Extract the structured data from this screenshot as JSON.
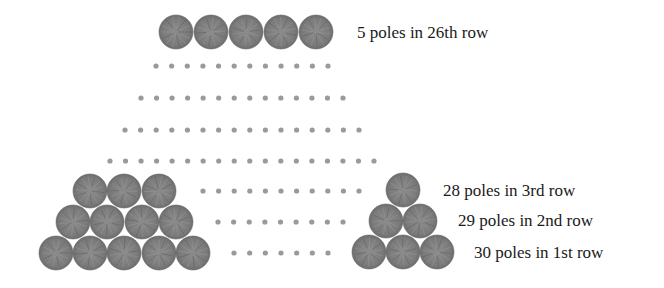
{
  "diagram": {
    "colors": {
      "pole_fill": "#7d7d7d",
      "pole_edge": "#6a6a6a",
      "pole_grain": "#a3a3a3",
      "dot": "#9a9a9a",
      "text": "#1a1a1a",
      "background": "#ffffff"
    },
    "pole_radius": 17,
    "dot_radius": 2.6,
    "top_row": {
      "count": 5,
      "y": 32,
      "x": [
        176,
        211,
        246,
        281,
        316
      ],
      "label": {
        "text": "5 poles in 26th row",
        "x": 357,
        "y": 32
      }
    },
    "dot_rows": [
      {
        "y": 66,
        "count": 12,
        "x_start": 156,
        "x_end": 328
      },
      {
        "y": 98,
        "count": 14,
        "x_start": 141,
        "x_end": 343
      },
      {
        "y": 130,
        "count": 16,
        "x_start": 125,
        "x_end": 359
      },
      {
        "y": 161,
        "count": 18,
        "x_start": 110,
        "x_end": 374
      },
      {
        "y": 191,
        "count": 11,
        "x_start": 203,
        "x_end": 359
      },
      {
        "y": 222,
        "count": 9,
        "x_start": 218,
        "x_end": 343
      },
      {
        "y": 253,
        "count": 7,
        "x_start": 234,
        "x_end": 328
      }
    ],
    "left_stack": [
      {
        "y": 191,
        "x": [
          90,
          124,
          159
        ]
      },
      {
        "y": 222,
        "x": [
          73,
          107,
          142,
          176
        ]
      },
      {
        "y": 253,
        "x": [
          56,
          90,
          124,
          159,
          193
        ]
      }
    ],
    "right_stack": [
      {
        "y": 190,
        "x": [
          403
        ]
      },
      {
        "y": 221,
        "x": [
          386,
          420
        ]
      },
      {
        "y": 252,
        "x": [
          369,
          403,
          437
        ]
      }
    ],
    "row_labels": [
      {
        "text": "28 poles in 3rd row",
        "x": 443,
        "y": 190
      },
      {
        "text": "29 poles in 2nd row",
        "x": 458,
        "y": 220
      },
      {
        "text": "30 poles in 1st row",
        "x": 474,
        "y": 252
      }
    ]
  }
}
